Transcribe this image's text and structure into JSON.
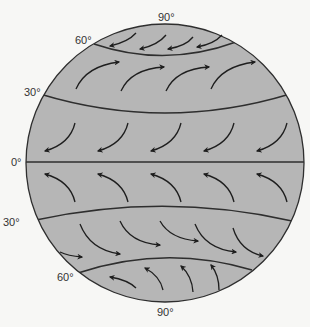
{
  "diagram": {
    "type": "global-wind-circulation",
    "colors": {
      "background": "#f7f7f5",
      "globe_fill": "#b6b6b6",
      "line": "#2e2e2e",
      "arrow": "#1e1e1e",
      "label": "#333333"
    },
    "labels": {
      "north_pole": "90°",
      "north_60": "60°",
      "north_30": "30°",
      "equator": "0°",
      "south_30": "30°",
      "south_60": "60°",
      "south_pole": "90°"
    },
    "bands": [
      {
        "name": "north-polar-easterlies",
        "direction": "toward lower-left",
        "arrow_count": 4
      },
      {
        "name": "north-westerlies",
        "direction": "curving up to the right",
        "arrow_count": 4
      },
      {
        "name": "northeast-trade-winds",
        "direction": "curving down to the left",
        "arrow_count": 5
      },
      {
        "name": "southeast-trade-winds",
        "direction": "curving up to the left",
        "arrow_count": 5
      },
      {
        "name": "south-westerlies",
        "direction": "curving down to the right",
        "arrow_count": 6
      },
      {
        "name": "south-polar-easterlies",
        "direction": "toward upper-left",
        "arrow_count": 4
      }
    ]
  }
}
